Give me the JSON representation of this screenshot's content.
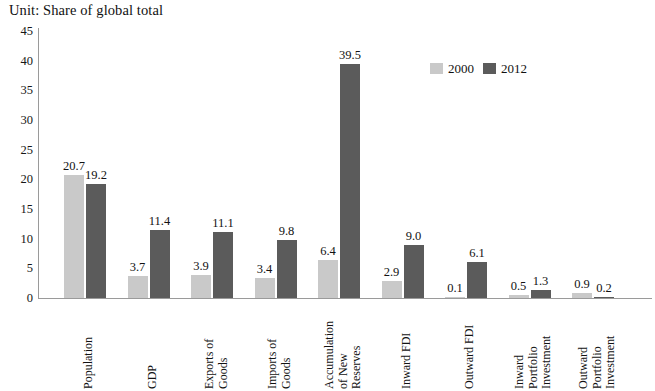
{
  "chart_data": {
    "type": "bar",
    "title": "Unit: Share of global total",
    "xlabel": "",
    "ylabel": "",
    "ylim": [
      0,
      45
    ],
    "ytick_step": 5,
    "yticks": [
      0,
      5,
      10,
      15,
      20,
      25,
      30,
      35,
      40,
      45
    ],
    "grid": false,
    "legend_position": "top-right",
    "categories": [
      "Population",
      "GDP",
      "Exports of\nGoods",
      "Imports of\nGoods",
      "Accumulation\nof New\nReserves",
      "Inward FDI",
      "Outward FDI",
      "Inward\nPortfolio\nInvestment",
      "Outward\nPortfolio\nInvestment"
    ],
    "series": [
      {
        "name": "2000",
        "color": "#c9c9c9",
        "values": [
          20.7,
          3.7,
          3.9,
          3.4,
          6.4,
          2.9,
          0.1,
          0.5,
          0.9
        ],
        "labels": [
          "20.7",
          "3.7",
          "3.9",
          "3.4",
          "6.4",
          "2.9",
          "0.1",
          "0.5",
          "0.9"
        ]
      },
      {
        "name": "2012",
        "color": "#5b5b5b",
        "values": [
          19.2,
          11.4,
          11.1,
          9.8,
          39.5,
          9.0,
          6.1,
          1.3,
          0.2
        ],
        "labels": [
          "19.2",
          "11.4",
          "11.1",
          "9.8",
          "39.5",
          "9.0",
          "6.1",
          "1.3",
          "0.2"
        ]
      }
    ]
  },
  "legend": {
    "items": [
      {
        "label": "2000",
        "swatch": "legend-swatch-2000"
      },
      {
        "label": "2012",
        "swatch": "legend-swatch-2012"
      }
    ]
  }
}
